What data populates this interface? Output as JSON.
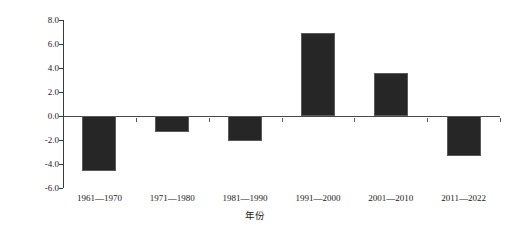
{
  "chart_data": {
    "type": "bar",
    "title": "",
    "xlabel": "年份",
    "ylabel": "降水日数距平/d",
    "categories": [
      "1961—1970",
      "1971—1980",
      "1981—1990",
      "1991—2000",
      "2001—2010",
      "2011—2022"
    ],
    "values": [
      -4.6,
      -1.35,
      -2.1,
      6.9,
      3.6,
      -3.35
    ],
    "ylim": [
      -6.0,
      8.0
    ],
    "ytick_labels": [
      "8.0",
      "6.0",
      "4.0",
      "2.0",
      "0.0",
      "-2.0",
      "-4.0",
      "-6.0"
    ],
    "ytick_values": [
      8.0,
      6.0,
      4.0,
      2.0,
      0.0,
      -2.0,
      -4.0,
      -6.0
    ],
    "grid": false,
    "legend": "none",
    "bar_color": "#262626",
    "bar_edge_color": "#5a5a5a",
    "axis_color": "#3b3b3b",
    "zero_line_color": "#4a4a4a",
    "background_color": "#ffffff"
  },
  "axes": {
    "y_title": "降水日数距平/d",
    "x_title": "年份"
  }
}
